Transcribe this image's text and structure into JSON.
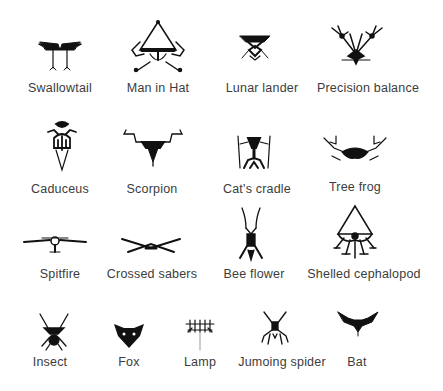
{
  "figure": {
    "rows": [
      {
        "items": [
          {
            "label": "Swallowtail",
            "icon": "swallowtail-biomorph"
          },
          {
            "label": "Man in Hat",
            "icon": "man-in-hat-biomorph"
          },
          {
            "label": "Lunar lander",
            "icon": "lunar-lander-biomorph"
          },
          {
            "label": "Precision balance",
            "icon": "precision-balance-biomorph"
          }
        ]
      },
      {
        "items": [
          {
            "label": "Caduceus",
            "icon": "caduceus-biomorph"
          },
          {
            "label": "Scorpion",
            "icon": "scorpion-biomorph"
          },
          {
            "label": "Cat's cradle",
            "icon": "cats-cradle-biomorph"
          },
          {
            "label": "Tree frog",
            "icon": "tree-frog-biomorph"
          }
        ]
      },
      {
        "items": [
          {
            "label": "Spitfire",
            "icon": "spitfire-biomorph"
          },
          {
            "label": "Crossed sabers",
            "icon": "crossed-sabers-biomorph"
          },
          {
            "label": "Bee flower",
            "icon": "bee-flower-biomorph"
          },
          {
            "label": "Shelled cephalopod",
            "icon": "shelled-cephalopod-biomorph"
          }
        ]
      },
      {
        "items": [
          {
            "label": "Insect",
            "icon": "insect-biomorph"
          },
          {
            "label": "Fox",
            "icon": "fox-biomorph"
          },
          {
            "label": "Lamp",
            "icon": "lamp-biomorph"
          },
          {
            "label": "Jumoing spider",
            "icon": "jumping-spider-biomorph"
          },
          {
            "label": "Bat",
            "icon": "bat-biomorph"
          }
        ]
      }
    ],
    "colors": {
      "ink": "#111111",
      "text": "#3c3c3c",
      "background": "#ffffff"
    }
  }
}
